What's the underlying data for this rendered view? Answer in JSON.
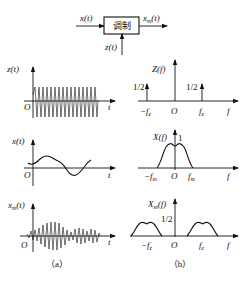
{
  "block_diagram": {
    "input_label": "x(t)",
    "output_label": "x_m(t)",
    "carrier_label": "z(t)",
    "block_label": "调制"
  },
  "panel_a": {
    "caption": "（a）",
    "plots": [
      {
        "y_label": "z(t)",
        "x_label": "t",
        "origin": "O",
        "description": "high-frequency carrier oscillation"
      },
      {
        "y_label": "x(t)",
        "x_label": "t",
        "origin": "O",
        "description": "low-frequency modulating signal"
      },
      {
        "y_label": "x_m(t)",
        "x_label": "t",
        "origin": "O",
        "description": "amplitude-modulated waveform"
      }
    ]
  },
  "panel_b": {
    "caption": "（b）",
    "plots": [
      {
        "y_label": "Z(f)",
        "x_label": "f",
        "origin": "O",
        "ticks": [
          "-f_z",
          "f_z"
        ],
        "annotations": [
          "1/2",
          "1/2"
        ]
      },
      {
        "y_label": "X(f)",
        "x_label": "f",
        "origin": "O",
        "ticks": [
          "-f_m",
          "f_m"
        ],
        "annotations": [
          "1"
        ]
      },
      {
        "y_label": "X_m(f)",
        "x_label": "f",
        "origin": "O",
        "ticks": [
          "-f_z",
          "f_z"
        ],
        "annotations": [
          "1/2"
        ]
      }
    ]
  }
}
